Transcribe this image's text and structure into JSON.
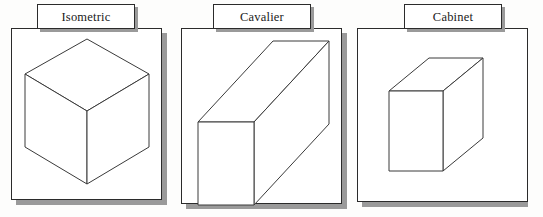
{
  "figure": {
    "background_color": "#ffffff",
    "line_color": "#3a3a3a",
    "shadow_color": "#9a9a9a",
    "panels": [
      {
        "id": "isometric",
        "label": "Isometric",
        "description": "Isometric projection of a cube: hexagonal outline with three visible rhombus faces meeting at a central vertex.",
        "frame": {
          "x": 11,
          "y": 28,
          "width": 151,
          "height": 172
        },
        "shadow_offset": 5,
        "label_box": {
          "x": 37,
          "y": 4,
          "width": 98,
          "height": 25
        }
      },
      {
        "id": "cavalier",
        "label": "Cavalier",
        "description": "Cavalier oblique projection of a cube: true-size square front face with full-depth receding edges at 45 degrees.",
        "frame": {
          "x": 181,
          "y": 28,
          "width": 161,
          "height": 176
        },
        "shadow_offset": 5,
        "label_box": {
          "x": 213,
          "y": 4,
          "width": 98,
          "height": 25
        }
      },
      {
        "id": "cabinet",
        "label": "Cabinet",
        "description": "Cabinet oblique projection of a cube: true-size square front face with half-depth receding edges at 45 degrees.",
        "frame": {
          "x": 357,
          "y": 28,
          "width": 171,
          "height": 174
        },
        "shadow_offset": 5,
        "label_box": {
          "x": 404,
          "y": 4,
          "width": 98,
          "height": 25
        }
      }
    ],
    "bleed_through_text": " "
  }
}
